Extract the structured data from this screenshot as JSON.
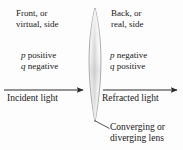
{
  "figure": {
    "background_color": "#fdfdfd",
    "ink_color": "#181818"
  },
  "labels": {
    "front_side": {
      "line1": "Front, or",
      "line2": "virtual, side"
    },
    "back_side": {
      "line1": "Back, or",
      "line2": "real, side"
    },
    "front_signs": {
      "p_var": "p",
      "p_sign": " positive",
      "q_var": "q",
      "q_sign": " negative"
    },
    "back_signs": {
      "p_var": "p",
      "p_sign": " negative",
      "q_var": "q",
      "q_sign": " positive"
    },
    "incident_light": "Incident light",
    "refracted_light": "Refracted light",
    "lens_caption": {
      "line1": "Converging or",
      "line2": "diverging lens"
    }
  },
  "icons": {
    "incident_arrow": "arrow-right-icon",
    "refracted_arrow": "arrow-right-icon",
    "lens": "biconvex-lens-icon",
    "leader": "leader-line-icon"
  },
  "geometry": {
    "lens_top_x": 95,
    "lens_top_y": 8,
    "lens_bottom_x": 95,
    "lens_bottom_y": 122,
    "lens_half_width": 9,
    "incident_arrow_y": 90,
    "incident_arrow_x1": 4,
    "incident_arrow_x2": 86,
    "refracted_arrow_y": 90,
    "refracted_arrow_x1": 103,
    "refracted_arrow_x2": 180,
    "leader_x1": 95,
    "leader_y1": 121,
    "leader_x2": 109,
    "leader_y2": 128
  }
}
